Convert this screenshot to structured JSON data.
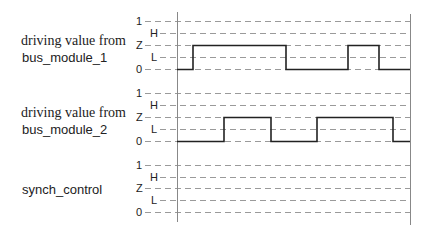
{
  "diagram": {
    "type": "timing-diagram",
    "levels": [
      "1",
      "H",
      "Z",
      "L",
      "0"
    ],
    "signals": [
      {
        "name_line1": "driving value from",
        "name_line2": "bus_module_1",
        "waveform": [
          {
            "from_x": 177,
            "to_x": 193,
            "level": "0"
          },
          {
            "from_x": 193,
            "to_x": 286,
            "level": "Z"
          },
          {
            "from_x": 286,
            "to_x": 348,
            "level": "0"
          },
          {
            "from_x": 348,
            "to_x": 379,
            "level": "Z"
          },
          {
            "from_x": 379,
            "to_x": 410,
            "level": "0"
          }
        ]
      },
      {
        "name_line1": "driving value from",
        "name_line2": "bus_module_2",
        "waveform": [
          {
            "from_x": 177,
            "to_x": 224,
            "level": "0"
          },
          {
            "from_x": 224,
            "to_x": 271,
            "level": "Z"
          },
          {
            "from_x": 271,
            "to_x": 317,
            "level": "0"
          },
          {
            "from_x": 317,
            "to_x": 393,
            "level": "Z"
          },
          {
            "from_x": 393,
            "to_x": 410,
            "level": "0"
          }
        ]
      },
      {
        "name_line1": "",
        "name_line2": "synch_control",
        "waveform": []
      }
    ],
    "colors": {
      "waveform": "#222222",
      "grid": "#9a9a9a",
      "axis": "#888888"
    }
  }
}
